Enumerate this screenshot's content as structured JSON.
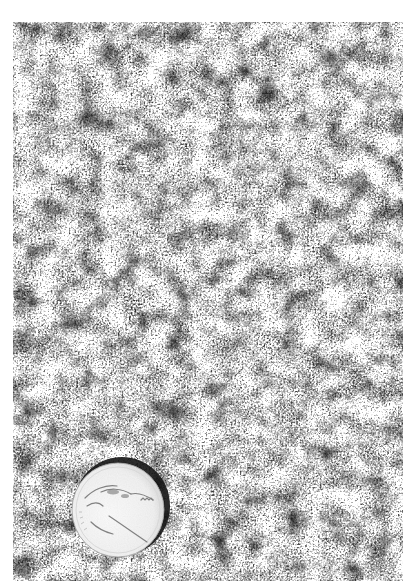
{
  "figure": {
    "tone": "grayscale",
    "scale_object": "coin",
    "colors": {
      "background": "#ffffff",
      "rock_mid": "#8a8a8a",
      "rock_dark": "#2e2e2e",
      "rock_light": "#e4e4e4",
      "coin_face": "#f4f4f4",
      "coin_shadow": "#1a1a1a"
    },
    "photo_bounds": {
      "x": 13,
      "y": 22,
      "width": 390,
      "height": 559
    },
    "coin": {
      "cx": 105,
      "cy": 487,
      "rx": 46,
      "ry": 47
    }
  }
}
